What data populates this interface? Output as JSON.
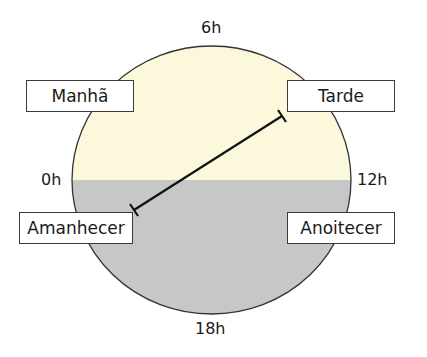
{
  "diagram": {
    "colors": {
      "day_fill": "#fbf8dc",
      "night_fill": "#c7c7c7",
      "outline": "#333333",
      "line": "#111111"
    },
    "hour_labels": {
      "top": "6h",
      "left": "0h",
      "right": "12h",
      "bottom": "18h"
    },
    "periods": {
      "top_left": "Manhã",
      "top_right": "Tarde",
      "bottom_left": "Amanhecer",
      "bottom_right": "Anoitecer"
    },
    "indicator": {
      "from": "Amanhecer",
      "to": "Tarde"
    }
  }
}
